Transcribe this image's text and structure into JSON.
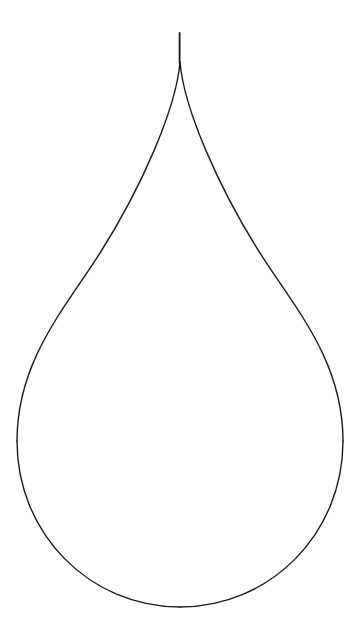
{
  "canvas": {
    "width": 360,
    "height": 632,
    "background_color": "#ffffff",
    "title": "Teardrop outline drawing"
  },
  "drawing": {
    "name": "teardrop",
    "description": "Line-art outline of a water drop / teardrop shape, unfilled, drawn with a thin black stroke on a plain white background",
    "stroke_color": "#1a1a1a",
    "fill_color": "none",
    "stroke_width": 1.4,
    "symmetry_axis_x": 180,
    "geometry": {
      "tip_spike": {
        "x": 179.5,
        "y_top": 33,
        "y_bottom": 62,
        "stroke_width": 1.8
      },
      "tip_point": {
        "x": 180,
        "y": 33
      },
      "split_point": {
        "x": 180,
        "y": 62
      },
      "leftmost_point": {
        "x": 17,
        "y": 441
      },
      "rightmost_point": {
        "x": 342,
        "y": 441
      },
      "bottom_point": {
        "x": 180,
        "y": 607
      },
      "bowl_center": {
        "x": 180,
        "y": 441
      },
      "bowl_radius_x": 163,
      "bowl_radius_y": 166
    },
    "paths": {
      "left_side": "M 180 62 C 176 110 140 190 100 253 C 66 307 17 360 17 441",
      "right_side": "M 180 62 C 184 110 220 190 260 253 C 294 307 343 360 343 441",
      "left_bowl": "M 17 441 C 17 534 90 607 180 607",
      "right_bowl": "M 343 441 C 343 534 270 607 180 607",
      "spike": "M 179.6 33 L 179.6 63"
    }
  }
}
